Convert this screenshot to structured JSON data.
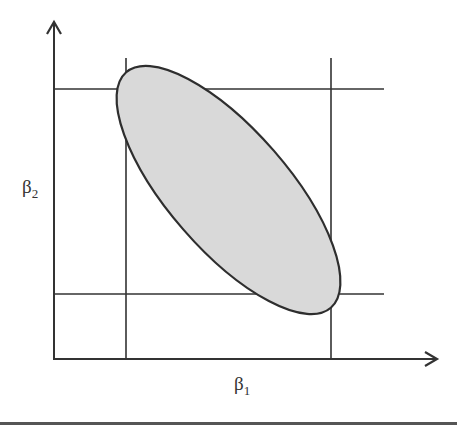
{
  "diagram": {
    "type": "confidence-region",
    "axes": {
      "x_label": "β",
      "x_label_subscript": "1",
      "y_label": "β",
      "y_label_subscript": "2"
    },
    "ellipse": {
      "fill": "#d9d9d9",
      "stroke": "#333333",
      "orientation": "negative correlation (tilted down-right)"
    },
    "interval_lines": {
      "vertical": [
        "beta1 lower bound",
        "beta1 upper bound"
      ],
      "horizontal": [
        "beta2 upper bound",
        "beta2 lower bound"
      ]
    },
    "colors": {
      "line": "#333333",
      "ellipse_fill": "#d9d9d9"
    }
  }
}
